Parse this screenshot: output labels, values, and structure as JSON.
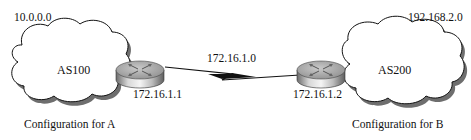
{
  "diagram": {
    "left_network": {
      "network_address": "10.0.0.0",
      "as_name": "AS100",
      "router_interface_ip": "172.16.1.1",
      "caption": "Configuration for A"
    },
    "right_network": {
      "network_address": "192.168.2.0",
      "as_name": "AS200",
      "router_interface_ip": "172.16.1.2",
      "caption": "Configuration for B"
    },
    "link": {
      "network_address": "172.16.1.0",
      "type": "serial-wan-link"
    },
    "colors": {
      "cloud_fill": "#ffffff",
      "cloud_shadow": "#6e6e6e",
      "router_top": "#a9a9a9",
      "router_side": "#c8c8c8",
      "line": "#111111"
    }
  }
}
